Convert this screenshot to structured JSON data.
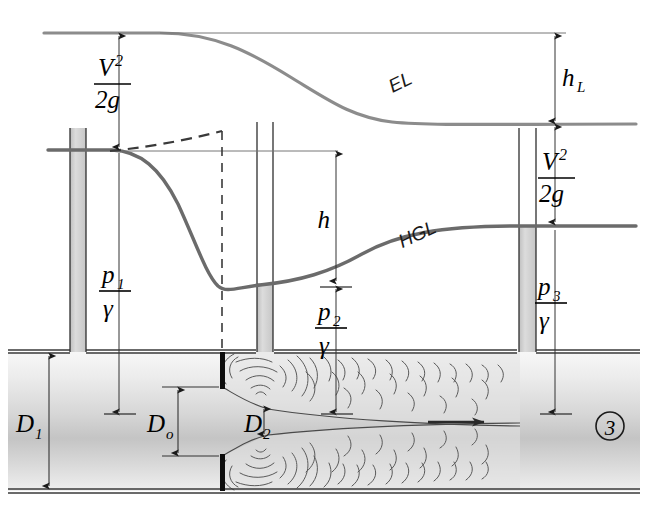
{
  "figure": {
    "type": "engineering-schematic"
  },
  "lines": {
    "el": {
      "name": "EL",
      "label": "EL",
      "description": "energy line",
      "color": "#808080"
    },
    "hgl": {
      "name": "HGL",
      "label": "HGL",
      "description": "hydraulic grade line",
      "color": "#6e6e6e"
    },
    "el_datum": {
      "label": "",
      "description": "horizontal extension of upstream energy line"
    },
    "hgl_datum": {
      "label": "",
      "description": "horizontal extension of upstream hydraulic grade line"
    },
    "dashed_recovery": {
      "label": "",
      "description": "dashed ideal pressure recovery curve"
    }
  },
  "dimensions": [
    {
      "id": "v2_2g_left",
      "numerator": "V",
      "numerator_exp": "2",
      "denominator": "2g",
      "label": "V²/2g",
      "description": "upstream velocity head"
    },
    {
      "id": "p1_gamma",
      "numerator": "p",
      "numerator_sub": "1",
      "denominator": "γ",
      "label": "p₁/γ",
      "description": "upstream pressure head"
    },
    {
      "id": "h",
      "label": "h",
      "description": "manometer differential head between sections 1 and 2"
    },
    {
      "id": "p2_gamma",
      "numerator": "p",
      "numerator_sub": "2",
      "denominator": "γ",
      "label": "p₂/γ",
      "description": "pressure head at vena contracta"
    },
    {
      "id": "hL",
      "label": "h",
      "sub": "L",
      "description": "head loss across the orifice"
    },
    {
      "id": "v2_2g_right",
      "numerator": "V",
      "numerator_exp": "2",
      "denominator": "2g",
      "label": "V²/2g",
      "description": "downstream velocity head"
    },
    {
      "id": "p3_gamma",
      "numerator": "p",
      "numerator_sub": "3",
      "denominator": "γ",
      "label": "p₃/γ",
      "description": "downstream pressure head"
    },
    {
      "id": "D1",
      "label": "D",
      "sub": "1",
      "description": "pipe diameter upstream"
    },
    {
      "id": "Do",
      "label": "D",
      "sub": "o",
      "description": "orifice diameter"
    },
    {
      "id": "D2",
      "label": "D",
      "sub": "2",
      "description": "vena contracta jet diameter"
    }
  ],
  "markers": {
    "section3": "3",
    "flow_arrow": "flow-direction"
  },
  "colors": {
    "el_line": "#8c8c8c",
    "hgl_line": "#6b6b6b",
    "pipe_fill_light": "#f2f2f2",
    "pipe_fill_mid": "#c9c9c9",
    "tube_fill": "#d2d2d2",
    "plate": "#0d0d0d",
    "thin_line": "#4d4d4d",
    "text": "#000000"
  },
  "tubes": [
    {
      "id": "piezometer-1",
      "label": "",
      "filled": true
    },
    {
      "id": "piezometer-2",
      "label": "",
      "filled": true
    },
    {
      "id": "piezometer-3",
      "label": "",
      "filled": true
    }
  ]
}
